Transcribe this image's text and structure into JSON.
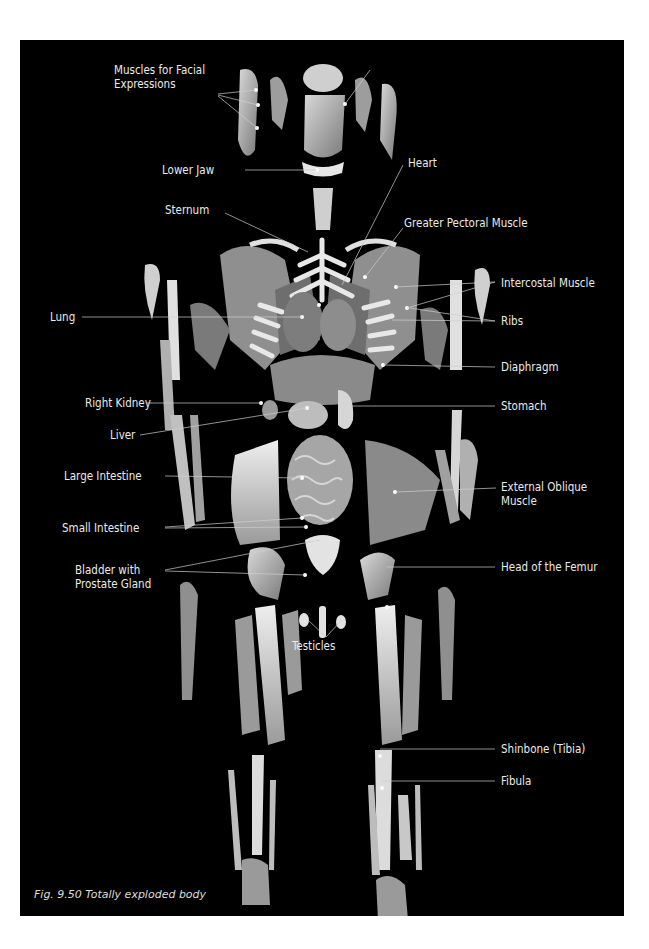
{
  "figure": {
    "caption": "Fig. 9.50 Totally exploded body",
    "background": "#000000",
    "label_color": "#eaeaea"
  },
  "labels": {
    "muscles_facial_1": "Muscles for Facial",
    "muscles_facial_2": "Expressions",
    "brain": "Brain",
    "lower_jaw": "Lower Jaw",
    "heart": "Heart",
    "sternum": "Sternum",
    "greater_pectoral": "Greater Pectoral Muscle",
    "lung": "Lung",
    "intercostal": "Intercostal Muscle",
    "ribs": "Ribs",
    "diaphragm": "Diaphragm",
    "right_kidney": "Right Kidney",
    "stomach": "Stomach",
    "liver": "Liver",
    "large_intestine": "Large Intestine",
    "external_oblique_1": "External Oblique",
    "external_oblique_2": "Muscle",
    "small_intestine": "Small Intestine",
    "bladder_1": "Bladder with",
    "bladder_2": "Prostate Gland",
    "head_femur": "Head of the Femur",
    "testicles": "Testicles",
    "shinbone": "Shinbone (Tibia)",
    "fibula": "Fibula"
  }
}
